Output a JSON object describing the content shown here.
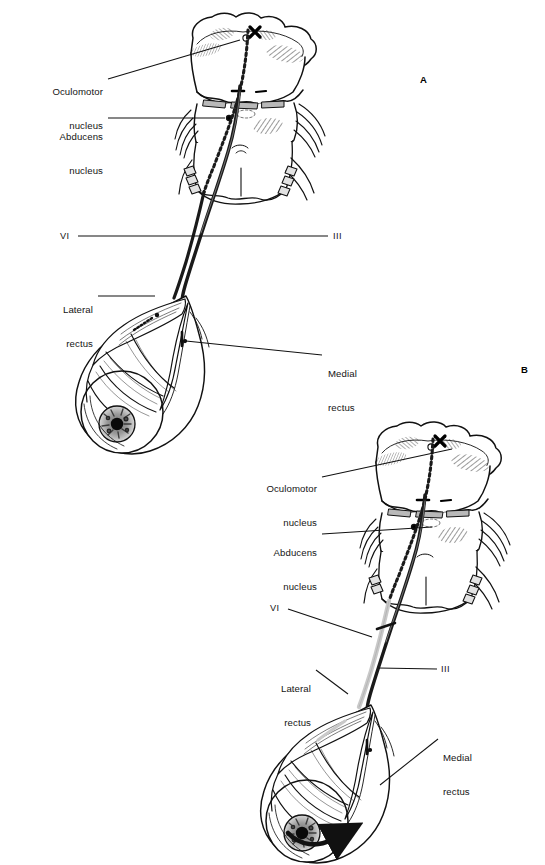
{
  "figure": {
    "background_color": "#ffffff",
    "ink_color": "#141414",
    "lesion_color": "#c9c9c9"
  },
  "panels": [
    {
      "id": "A",
      "letter": "A",
      "letter_x": 420,
      "letter_y": 74,
      "description": "Normal state: intact abducens and oculomotor pathways",
      "labels": [
        {
          "name": "oculomotor-nucleus",
          "text_line1": "Oculomotor",
          "text_line2": "nucleus",
          "align": "right",
          "x": 8,
          "y": 63,
          "width": 95,
          "leader": {
            "x1": 108,
            "y1": 79,
            "x2": 240,
            "y2": 40
          }
        },
        {
          "name": "abducens-nucleus",
          "text_line1": "Abducens",
          "text_line2": "nucleus",
          "align": "right",
          "x": 8,
          "y": 108,
          "width": 95,
          "leader": {
            "x1": 108,
            "y1": 118,
            "x2": 225,
            "y2": 118
          }
        },
        {
          "name": "lateral-rectus",
          "text_line1": "Lateral",
          "text_line2": "rectus",
          "align": "right",
          "x": 18,
          "y": 281,
          "width": 75,
          "leader": {
            "x1": 98,
            "y1": 296,
            "x2": 155,
            "y2": 296
          }
        },
        {
          "name": "medial-rectus",
          "text_line1": "Medial",
          "text_line2": "rectus",
          "align": "left",
          "x": 328,
          "y": 345,
          "width": 80,
          "leader": {
            "x1": 322,
            "y1": 355,
            "x2": 186,
            "y2": 341
          }
        }
      ],
      "nerve_markers": [
        {
          "name": "nerve-vi-label",
          "text": "VI",
          "x": 60,
          "y": 231
        },
        {
          "name": "nerve-iii-label",
          "text": "III",
          "x": 333,
          "y": 231
        }
      ],
      "connector_line": {
        "x1": 78,
        "y1": 236,
        "x2": 328,
        "y2": 236
      },
      "has_motion_arrow": false
    },
    {
      "id": "B",
      "letter": "B",
      "letter_x": 521,
      "letter_y": 364,
      "description": "Lesion of the abducens nerve: lateral rectus palsy with medial deviation of the eye",
      "labels": [
        {
          "name": "oculomotor-nucleus",
          "text_line1": "Oculomotor",
          "text_line2": "nucleus",
          "align": "right",
          "x": 222,
          "y": 460,
          "width": 95,
          "leader": {
            "x1": 322,
            "y1": 477,
            "x2": 452,
            "y2": 449
          }
        },
        {
          "name": "abducens-nucleus",
          "text_line1": "Abducens",
          "text_line2": "nucleus",
          "align": "right",
          "x": 222,
          "y": 524,
          "width": 95,
          "leader": {
            "x1": 322,
            "y1": 534,
            "x2": 432,
            "y2": 527
          }
        },
        {
          "name": "lateral-rectus",
          "text_line1": "Lateral",
          "text_line2": "rectus",
          "align": "right",
          "x": 236,
          "y": 660,
          "width": 75,
          "leader": {
            "x1": 316,
            "y1": 670,
            "x2": 348,
            "y2": 694
          }
        },
        {
          "name": "medial-rectus",
          "text_line1": "Medial",
          "text_line2": "rectus",
          "align": "left",
          "x": 443,
          "y": 729,
          "width": 80,
          "leader": {
            "x1": 438,
            "y1": 739,
            "x2": 380,
            "y2": 785
          }
        }
      ],
      "nerve_markers": [
        {
          "name": "nerve-vi-label",
          "text": "VI",
          "x": 270,
          "y": 603
        },
        {
          "name": "nerve-iii-label",
          "text": "III",
          "x": 441,
          "y": 664
        }
      ],
      "connector_line": null,
      "vi_leader": {
        "x1": 288,
        "y1": 609,
        "x2": 372,
        "y2": 637
      },
      "iii_leader": {
        "x1": 437,
        "y1": 669,
        "x2": 378,
        "y2": 668
      },
      "has_motion_arrow": true,
      "motion_arrow": {
        "name": "eye-deviation-arrow",
        "direction": "right",
        "x": 288,
        "y": 828
      }
    }
  ],
  "legend_notes": {
    "solid_tract": "Oculomotor (III) pathway — solid dark tract",
    "dotted_tract": "Abducens (VI) internuclear pathway — dotted tract",
    "grey_tract": "Lesioned / non-functional abducens nerve (panel B)"
  }
}
